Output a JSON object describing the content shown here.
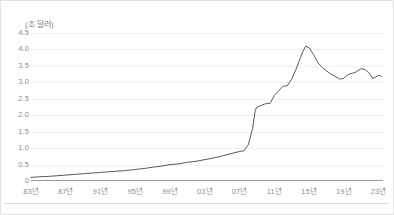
{
  "chart_data": {
    "type": "line",
    "title": "",
    "subtitle": "",
    "xlabel": "",
    "ylabel": "(조 달러)",
    "unit_label": "(조 달러)",
    "grid": true,
    "legend": false,
    "legend_position": "none",
    "line_color": "#595959",
    "grid_color": "#f0f0f0",
    "axis_color": "#9a9a9a",
    "tick_label_color": "#8d8d8d",
    "xlim": [
      1983,
      2023.5
    ],
    "ylim": [
      0,
      4.5
    ],
    "ytick_labels": [
      "4.5",
      "4.0",
      "3.5",
      "3.0",
      "2.5",
      "2.0",
      "1.5",
      "1.0",
      "0.5",
      "0"
    ],
    "ytick_values": [
      4.5,
      4.0,
      3.5,
      3.0,
      2.5,
      2.0,
      1.5,
      1.0,
      0.5,
      0
    ],
    "xtick_labels": [
      "83년",
      "87년",
      "91년",
      "95년",
      "99년",
      "03년",
      "07년",
      "11년",
      "15년",
      "19년",
      "23년"
    ],
    "xtick_values": [
      1983,
      1987,
      1991,
      1995,
      1999,
      2003,
      2007,
      2011,
      2015,
      2019,
      2023
    ],
    "series": [
      {
        "name": "",
        "x": [
          1983,
          1984,
          1985,
          1986,
          1987,
          1988,
          1989,
          1990,
          1991,
          1992,
          1993,
          1994,
          1995,
          1996,
          1997,
          1998,
          1999,
          2000,
          2001,
          2002,
          2003,
          2004,
          2005,
          2006,
          2007,
          2007.5,
          2008,
          2008.5,
          2008.8,
          2009,
          2009.5,
          2010,
          2010.5,
          2011,
          2011.5,
          2012,
          2012.5,
          2013,
          2013.5,
          2014,
          2014.3,
          2014.6,
          2015,
          2015.5,
          2016,
          2016.5,
          2017,
          2017.5,
          2018,
          2018.5,
          2019,
          2019.3,
          2019.6,
          2020,
          2020.3,
          2020.6,
          2021,
          2021.5,
          2022,
          2022.3,
          2022.6,
          2023,
          2023.3
        ],
        "values": [
          0.11,
          0.13,
          0.14,
          0.16,
          0.18,
          0.2,
          0.22,
          0.24,
          0.26,
          0.28,
          0.3,
          0.32,
          0.35,
          0.38,
          0.42,
          0.45,
          0.5,
          0.52,
          0.57,
          0.6,
          0.65,
          0.7,
          0.76,
          0.83,
          0.9,
          0.92,
          1.1,
          1.6,
          2.15,
          2.25,
          2.3,
          2.35,
          2.36,
          2.6,
          2.75,
          2.88,
          2.9,
          3.1,
          3.4,
          3.75,
          3.95,
          4.1,
          4.05,
          3.85,
          3.6,
          3.45,
          3.35,
          3.25,
          3.18,
          3.1,
          3.12,
          3.2,
          3.25,
          3.28,
          3.3,
          3.35,
          3.42,
          3.38,
          3.25,
          3.12,
          3.15,
          3.22,
          3.18
        ]
      }
    ]
  }
}
